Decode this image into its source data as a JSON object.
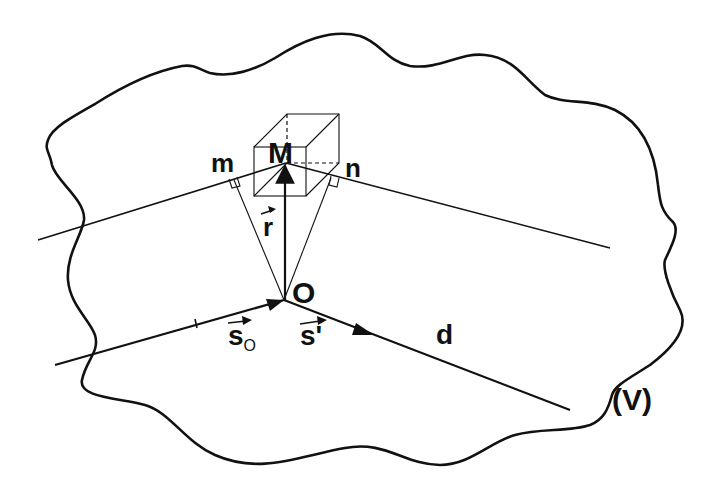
{
  "figure": {
    "region_label": "(V)",
    "point_M": "M",
    "point_O": "O",
    "foot_m": "m",
    "foot_n": "n",
    "vector_r": "r",
    "vector_s0_base": "s",
    "vector_s0_sub": "O",
    "vector_s_prime": "s'",
    "ray_label": "d"
  },
  "colors": {
    "ink": "#111111",
    "background": "#ffffff"
  }
}
